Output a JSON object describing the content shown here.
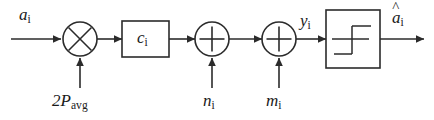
{
  "diagram": {
    "type": "signal-flow-block-diagram",
    "canvas": {
      "width": 434,
      "height": 120,
      "background": "#ffffff"
    },
    "stroke_color": "#2b2b2b",
    "text_color": "#1a1a1a",
    "labels": {
      "input_signal": {
        "base": "a",
        "sub": "i",
        "text": "a_i"
      },
      "gain_factor": {
        "prefix": "2",
        "base": "P",
        "sub": "avg",
        "text": "2P_avg"
      },
      "channel_coefficient": {
        "base": "c",
        "sub": "i",
        "text": "c_i"
      },
      "noise_n": {
        "base": "n",
        "sub": "i",
        "text": "n_i"
      },
      "noise_m": {
        "base": "m",
        "sub": "i",
        "text": "m_i"
      },
      "received_signal": {
        "base": "y",
        "sub": "i",
        "text": "y_i"
      },
      "output_estimate": {
        "hat": "^",
        "base": "a",
        "sub": "i",
        "text": "a_hat_i"
      }
    },
    "blocks": [
      {
        "name": "multiplier",
        "shape": "circle",
        "glyph": "cross-x",
        "cx": 80,
        "cy": 39,
        "r": 17
      },
      {
        "name": "gain-box",
        "shape": "rectangle",
        "glyph": "c_i",
        "x": 122,
        "y": 21,
        "w": 47,
        "h": 36
      },
      {
        "name": "adder-1",
        "shape": "circle",
        "glyph": "plus",
        "cx": 212,
        "cy": 39,
        "r": 17
      },
      {
        "name": "adder-2",
        "shape": "circle",
        "glyph": "plus",
        "cx": 279,
        "cy": 39,
        "r": 17
      },
      {
        "name": "decision-block",
        "shape": "rectangle",
        "glyph": "step-function",
        "x": 326,
        "y": 10,
        "w": 54,
        "h": 58
      }
    ],
    "connections": [
      {
        "from": "input",
        "to": "multiplier",
        "direction": "right"
      },
      {
        "from": "gain-factor",
        "to": "multiplier",
        "direction": "up"
      },
      {
        "from": "multiplier",
        "to": "gain-box",
        "direction": "right"
      },
      {
        "from": "gain-box",
        "to": "adder-1",
        "direction": "right"
      },
      {
        "from": "noise_n",
        "to": "adder-1",
        "direction": "up"
      },
      {
        "from": "adder-1",
        "to": "adder-2",
        "direction": "right"
      },
      {
        "from": "noise_m",
        "to": "adder-2",
        "direction": "up"
      },
      {
        "from": "adder-2",
        "to": "decision-block",
        "direction": "right"
      },
      {
        "from": "decision-block",
        "to": "output",
        "direction": "right"
      }
    ]
  }
}
